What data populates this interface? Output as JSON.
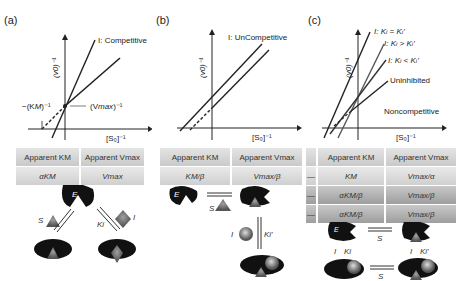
{
  "panels": [
    {
      "label": "(a)",
      "plot": {
        "y_axis_label": "(v0)^-1",
        "x_axis_label": "[S0]^-1",
        "line_label": "I: Competitive",
        "x_intercept_label": "-(KM)^-1",
        "y_intercept_label": "(Vmax)^-1"
      },
      "table": {
        "headers": [
          "Apparent KM",
          "Apparent Vmax"
        ],
        "rows": [
          [
            "αKM",
            "Vmax"
          ]
        ]
      },
      "scheme": {
        "enzyme": "E",
        "substrate": "S",
        "inhibitor": "I",
        "constant": "Ki"
      }
    },
    {
      "label": "(b)",
      "plot": {
        "y_axis_label": "(v0)^-1",
        "x_axis_label": "[S0]^-1",
        "line_label": "I: UnCompetitive"
      },
      "table": {
        "headers": [
          "Apparent KM",
          "Apparent Vmax"
        ],
        "rows": [
          [
            "KM/β",
            "Vmax/β"
          ]
        ]
      },
      "scheme": {
        "enzyme": "E",
        "substrate": "S",
        "inhibitor": "I",
        "constant": "Ki'"
      }
    },
    {
      "label": "(c)",
      "plot": {
        "y_axis_label": "(v0)^-1",
        "x_axis_label": "[S0]^-1",
        "line_labels": [
          "I: Ki = Ki'",
          "I: Ki > Ki'",
          "I: Ki < Ki'",
          "Uninhibited"
        ],
        "type_label": "Noncompetitive"
      },
      "table": {
        "headers": [
          "Apparent KM",
          "Apparent Vmax"
        ],
        "rows": [
          [
            "—",
            "KM",
            "Vmax/α"
          ],
          [
            "—",
            "αKM/β",
            "Vmax/β"
          ],
          [
            "—",
            "αKM/β",
            "Vmax/β"
          ]
        ]
      },
      "scheme": {
        "enzyme": "E",
        "substrate": "S",
        "inhibitor": "I",
        "constant_1": "Ki",
        "constant_2": "Ki'"
      }
    }
  ]
}
